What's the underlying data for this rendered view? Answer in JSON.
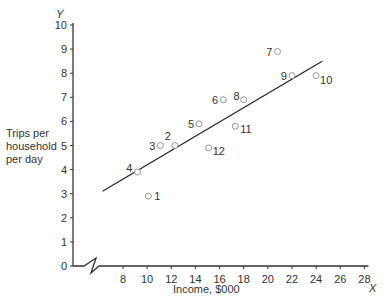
{
  "chart_data": {
    "type": "scatter",
    "title": "",
    "xlabel": "Income, $000",
    "ylabel": "Trips per household per day",
    "x_axis_letter": "X",
    "y_axis_letter": "Y",
    "xlim": [
      0,
      28
    ],
    "ylim": [
      0,
      10
    ],
    "x_axis_break": true,
    "x_ticks": [
      8,
      10,
      12,
      14,
      16,
      18,
      20,
      22,
      24,
      26,
      28
    ],
    "y_ticks": [
      0,
      1,
      2,
      3,
      4,
      5,
      6,
      7,
      8,
      9,
      10
    ],
    "grid": false,
    "legend": null,
    "points": [
      {
        "label": "1",
        "x": 10.1,
        "y": 2.9
      },
      {
        "label": "2",
        "x": 12.3,
        "y": 5.0
      },
      {
        "label": "3",
        "x": 11.1,
        "y": 5.0
      },
      {
        "label": "4",
        "x": 9.2,
        "y": 3.9
      },
      {
        "label": "5",
        "x": 14.3,
        "y": 5.9
      },
      {
        "label": "6",
        "x": 16.3,
        "y": 6.9
      },
      {
        "label": "7",
        "x": 20.8,
        "y": 8.9
      },
      {
        "label": "8",
        "x": 18.0,
        "y": 6.9
      },
      {
        "label": "9",
        "x": 22.0,
        "y": 7.9
      },
      {
        "label": "10",
        "x": 24.0,
        "y": 7.9
      },
      {
        "label": "11",
        "x": 17.3,
        "y": 5.8
      },
      {
        "label": "12",
        "x": 15.1,
        "y": 4.9
      }
    ],
    "regression_line": {
      "x1": 6.3,
      "y1": 3.1,
      "x2": 24.5,
      "y2": 8.5
    }
  },
  "labels": {
    "ylabel_lines": [
      "Trips per",
      "household",
      "per day"
    ],
    "xlabel": "Income, $000",
    "x_letter": "X",
    "y_letter": "Y"
  }
}
